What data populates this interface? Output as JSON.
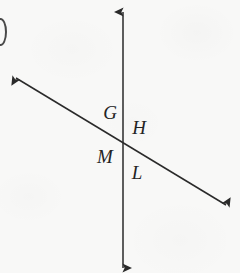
{
  "figure": {
    "width": 240,
    "height": 273,
    "background_color": "#f8f8f7",
    "stroke_color": "#2a2a2a",
    "label_color": "#242424",
    "stroke_width": 1.5
  },
  "lines": [
    {
      "name": "vertical-line",
      "style": "double-headed arrow",
      "x1": 123,
      "y1": 12,
      "x2": 123,
      "y2": 268,
      "orientation": "vertical"
    },
    {
      "name": "diagonal-line",
      "style": "double-headed arrow",
      "x1": 16,
      "y1": 78,
      "x2": 226,
      "y2": 205,
      "orientation": "descending-left-to-right",
      "slope": 0.6,
      "angle_degrees": 31
    }
  ],
  "intersection": {
    "name": "intersection-point",
    "x": 123,
    "y": 142
  },
  "labels": [
    {
      "text": "G",
      "x": 110,
      "y": 112,
      "region": "upper-left"
    },
    {
      "text": "H",
      "x": 139,
      "y": 127,
      "region": "upper-right"
    },
    {
      "text": "M",
      "x": 105,
      "y": 156,
      "region": "lower-left"
    },
    {
      "text": "L",
      "x": 137,
      "y": 172,
      "region": "lower-right"
    }
  ],
  "edge_artifact": {
    "name": "cropped-figure-label",
    "description": "partial dark arc at left margin"
  }
}
